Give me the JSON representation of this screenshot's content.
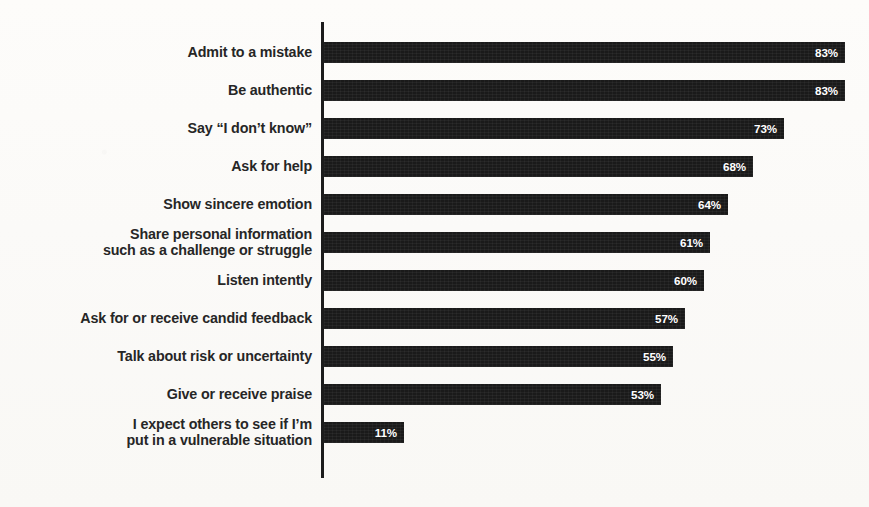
{
  "chart_data": {
    "type": "bar",
    "orientation": "horizontal",
    "title": "",
    "subtitle": "",
    "xlabel": "",
    "ylabel": "",
    "xlim": [
      0,
      100
    ],
    "grid": false,
    "legend": false,
    "value_suffix": "%",
    "categories": [
      "Admit to a mistake",
      "Be authentic",
      "Say “I don’t know”",
      "Ask for help",
      "Show sincere emotion",
      "Share personal information such as a challenge or struggle",
      "Listen intently",
      "Ask for or receive candid feedback",
      "Talk about risk or uncertainty",
      "Give or receive praise",
      "I expect others to see if I’m put in a vulnerable situation"
    ],
    "values": [
      83,
      83,
      73,
      68,
      64,
      61,
      60,
      57,
      55,
      53,
      11
    ],
    "value_labels": [
      "83%",
      "83%",
      "73%",
      "68%",
      "64%",
      "61%",
      "60%",
      "57%",
      "55%",
      "53%",
      "11%"
    ],
    "colors": {
      "bar": "#1a1a1a",
      "value_text": "#ffffff",
      "category_text": "#262626",
      "axis": "#1c1c1c",
      "background": "#fbfaf8"
    }
  },
  "rows": [
    {
      "label_line1": "Admit to a mistake",
      "label_line2": "",
      "value": "83%",
      "width_px": 521
    },
    {
      "label_line1": "Be authentic",
      "label_line2": "",
      "value": "83%",
      "width_px": 521
    },
    {
      "label_line1": "Say “I don’t know”",
      "label_line2": "",
      "value": "73%",
      "width_px": 460
    },
    {
      "label_line1": "Ask for help",
      "label_line2": "",
      "value": "68%",
      "width_px": 429
    },
    {
      "label_line1": "Show sincere emotion",
      "label_line2": "",
      "value": "64%",
      "width_px": 404
    },
    {
      "label_line1": "Share personal information",
      "label_line2": "such as a challenge or struggle",
      "value": "61%",
      "width_px": 386
    },
    {
      "label_line1": "Listen intently",
      "label_line2": "",
      "value": "60%",
      "width_px": 380
    },
    {
      "label_line1": "Ask for or receive candid feedback",
      "label_line2": "",
      "value": "57%",
      "width_px": 361
    },
    {
      "label_line1": "Talk about risk or uncertainty",
      "label_line2": "",
      "value": "55%",
      "width_px": 349
    },
    {
      "label_line1": "Give or receive praise",
      "label_line2": "",
      "value": "53%",
      "width_px": 337
    },
    {
      "label_line1": "I expect others to see if I’m",
      "label_line2": "put in a vulnerable situation",
      "value": "11%",
      "width_px": 80
    }
  ]
}
